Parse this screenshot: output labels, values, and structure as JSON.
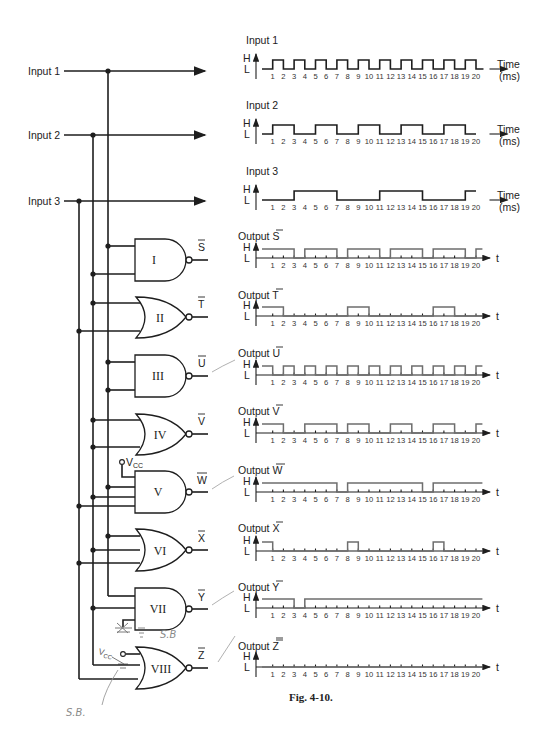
{
  "figure": {
    "caption": "Fig. 4-10.",
    "inputs": [
      {
        "label": "Input 1"
      },
      {
        "label": "Input 2"
      },
      {
        "label": "Input 3"
      }
    ],
    "gates": [
      {
        "id": "I",
        "type": "NAND",
        "output": "S"
      },
      {
        "id": "II",
        "type": "NOR",
        "output": "T"
      },
      {
        "id": "III",
        "type": "NAND",
        "output": "U"
      },
      {
        "id": "IV",
        "type": "NOR",
        "output": "V"
      },
      {
        "id": "V",
        "type": "NAND",
        "output": "W",
        "extra_input": "VCC"
      },
      {
        "id": "VI",
        "type": "NOR",
        "output": "X"
      },
      {
        "id": "VII",
        "type": "NAND",
        "output": "Y"
      },
      {
        "id": "VIII",
        "type": "NOR",
        "output": "Z",
        "extra_input": "VCC"
      }
    ],
    "vcc_label": "V",
    "vcc_sub": "CC",
    "handwritten_notes": [
      "S.B",
      "S.B."
    ]
  },
  "axes": {
    "high": "H",
    "low": "L",
    "time_label": "Time",
    "time_unit": "(ms)",
    "t_label": "t",
    "ticks": [
      "1",
      "2",
      "3",
      "4",
      "5",
      "6",
      "7",
      "8",
      "9",
      "10",
      "11",
      "12",
      "13",
      "14",
      "15",
      "16",
      "17",
      "18",
      "19",
      "20"
    ]
  },
  "chart_data": [
    {
      "type": "line",
      "title": "Input 1",
      "xlabel": "Time (ms)",
      "ylabel": "H/L",
      "x": [
        0,
        1,
        2,
        3,
        4,
        5,
        6,
        7,
        8,
        9,
        10,
        11,
        12,
        13,
        14,
        15,
        16,
        17,
        18,
        19,
        20
      ],
      "values": [
        "L",
        "H",
        "L",
        "H",
        "L",
        "H",
        "L",
        "H",
        "L",
        "H",
        "L",
        "H",
        "L",
        "H",
        "L",
        "H",
        "L",
        "H",
        "L",
        "H",
        "L"
      ]
    },
    {
      "type": "line",
      "title": "Input 2",
      "xlabel": "Time (ms)",
      "ylabel": "H/L",
      "segments": [
        {
          "from": 0,
          "to": 1,
          "level": "L"
        },
        {
          "from": 1,
          "to": 3,
          "level": "H"
        },
        {
          "from": 3,
          "to": 5,
          "level": "L"
        },
        {
          "from": 5,
          "to": 7,
          "level": "H"
        },
        {
          "from": 7,
          "to": 9,
          "level": "L"
        },
        {
          "from": 9,
          "to": 11,
          "level": "H"
        },
        {
          "from": 11,
          "to": 13,
          "level": "L"
        },
        {
          "from": 13,
          "to": 15,
          "level": "H"
        },
        {
          "from": 15,
          "to": 17,
          "level": "L"
        },
        {
          "from": 17,
          "to": 19,
          "level": "H"
        },
        {
          "from": 19,
          "to": 20,
          "level": "L"
        }
      ]
    },
    {
      "type": "line",
      "title": "Input 3",
      "xlabel": "Time (ms)",
      "ylabel": "H/L",
      "segments": [
        {
          "from": 0,
          "to": 3,
          "level": "L"
        },
        {
          "from": 3,
          "to": 7,
          "level": "H"
        },
        {
          "from": 7,
          "to": 11,
          "level": "L"
        },
        {
          "from": 11,
          "to": 15,
          "level": "H"
        },
        {
          "from": 15,
          "to": 19,
          "level": "L"
        },
        {
          "from": 19,
          "to": 20,
          "level": "H"
        }
      ]
    },
    {
      "type": "line",
      "title": "Output S̄",
      "xlabel": "t",
      "ylabel": "H/L",
      "hand_drawn": true,
      "segments": [
        {
          "from": 0,
          "to": 3,
          "level": "H"
        },
        {
          "from": 3,
          "to": 4,
          "level": "L"
        },
        {
          "from": 4,
          "to": 7,
          "level": "H"
        },
        {
          "from": 7,
          "to": 8,
          "level": "L"
        },
        {
          "from": 8,
          "to": 11,
          "level": "H"
        },
        {
          "from": 11,
          "to": 12,
          "level": "L"
        },
        {
          "from": 12,
          "to": 15,
          "level": "H"
        },
        {
          "from": 15,
          "to": 16,
          "level": "L"
        },
        {
          "from": 16,
          "to": 19,
          "level": "H"
        },
        {
          "from": 19,
          "to": 20,
          "level": "L"
        },
        {
          "from": 20,
          "to": 21,
          "level": "H"
        }
      ]
    },
    {
      "type": "line",
      "title": "Output T̄",
      "xlabel": "t",
      "ylabel": "H/L",
      "hand_drawn": true,
      "segments": [
        {
          "from": 0,
          "to": 2,
          "level": "H"
        },
        {
          "from": 2,
          "to": 8,
          "level": "L"
        },
        {
          "from": 8,
          "to": 10,
          "level": "H"
        },
        {
          "from": 10,
          "to": 16,
          "level": "L"
        },
        {
          "from": 16,
          "to": 18,
          "level": "H"
        },
        {
          "from": 18,
          "to": 21,
          "level": "L"
        }
      ]
    },
    {
      "type": "line",
      "title": "Output Ū",
      "xlabel": "t",
      "ylabel": "H/L",
      "hand_drawn": true,
      "segments": [
        {
          "from": 0,
          "to": 1,
          "level": "H"
        },
        {
          "from": 1,
          "to": 2,
          "level": "L"
        },
        {
          "from": 2,
          "to": 3,
          "level": "H"
        },
        {
          "from": 3,
          "to": 4,
          "level": "L"
        },
        {
          "from": 4,
          "to": 5,
          "level": "H"
        },
        {
          "from": 5,
          "to": 6,
          "level": "L"
        },
        {
          "from": 6,
          "to": 7,
          "level": "H"
        },
        {
          "from": 7,
          "to": 8,
          "level": "L"
        },
        {
          "from": 8,
          "to": 9,
          "level": "H"
        },
        {
          "from": 9,
          "to": 10,
          "level": "L"
        },
        {
          "from": 10,
          "to": 11,
          "level": "H"
        },
        {
          "from": 11,
          "to": 12,
          "level": "L"
        },
        {
          "from": 12,
          "to": 13,
          "level": "H"
        },
        {
          "from": 13,
          "to": 14,
          "level": "L"
        },
        {
          "from": 14,
          "to": 15,
          "level": "H"
        },
        {
          "from": 15,
          "to": 16,
          "level": "L"
        },
        {
          "from": 16,
          "to": 17,
          "level": "H"
        },
        {
          "from": 17,
          "to": 18,
          "level": "L"
        },
        {
          "from": 18,
          "to": 19,
          "level": "H"
        },
        {
          "from": 19,
          "to": 20,
          "level": "L"
        },
        {
          "from": 20,
          "to": 21,
          "level": "H"
        }
      ]
    },
    {
      "type": "line",
      "title": "Output V̄",
      "xlabel": "t",
      "ylabel": "H/L",
      "hand_drawn": true,
      "segments": [
        {
          "from": 0,
          "to": 2,
          "level": "H"
        },
        {
          "from": 2,
          "to": 4,
          "level": "L"
        },
        {
          "from": 4,
          "to": 7,
          "level": "H"
        },
        {
          "from": 7,
          "to": 8,
          "level": "L"
        },
        {
          "from": 8,
          "to": 10,
          "level": "H"
        },
        {
          "from": 10,
          "to": 12,
          "level": "L"
        },
        {
          "from": 12,
          "to": 14,
          "level": "H"
        },
        {
          "from": 14,
          "to": 16,
          "level": "L"
        },
        {
          "from": 16,
          "to": 18,
          "level": "H"
        },
        {
          "from": 18,
          "to": 20,
          "level": "L"
        },
        {
          "from": 20,
          "to": 21,
          "level": "H"
        }
      ]
    },
    {
      "type": "line",
      "title": "Output W̄",
      "xlabel": "t",
      "ylabel": "H/L",
      "hand_drawn": true,
      "segments": [
        {
          "from": 0,
          "to": 7,
          "level": "H"
        },
        {
          "from": 7,
          "to": 8,
          "level": "L"
        },
        {
          "from": 8,
          "to": 15,
          "level": "H"
        },
        {
          "from": 15,
          "to": 16,
          "level": "L"
        },
        {
          "from": 16,
          "to": 21,
          "level": "H"
        }
      ]
    },
    {
      "type": "line",
      "title": "Output X̄",
      "xlabel": "t",
      "ylabel": "H/L",
      "hand_drawn": true,
      "segments": [
        {
          "from": 0,
          "to": 1,
          "level": "H"
        },
        {
          "from": 1,
          "to": 8,
          "level": "L"
        },
        {
          "from": 8,
          "to": 9,
          "level": "H"
        },
        {
          "from": 9,
          "to": 16,
          "level": "L"
        },
        {
          "from": 16,
          "to": 17,
          "level": "H"
        },
        {
          "from": 17,
          "to": 21,
          "level": "L"
        }
      ]
    },
    {
      "type": "line",
      "title": "Output Ȳ",
      "xlabel": "t",
      "ylabel": "H/L",
      "hand_drawn": true,
      "segments": [
        {
          "from": 0,
          "to": 3,
          "level": "H"
        },
        {
          "from": 3,
          "to": 4,
          "level": "L"
        },
        {
          "from": 4,
          "to": 21,
          "level": "H"
        }
      ]
    },
    {
      "type": "line",
      "title": "Output Z̄",
      "xlabel": "t",
      "ylabel": "H/L",
      "hand_drawn": true,
      "segments": [
        {
          "from": 0,
          "to": 21,
          "level": "L"
        }
      ]
    }
  ]
}
